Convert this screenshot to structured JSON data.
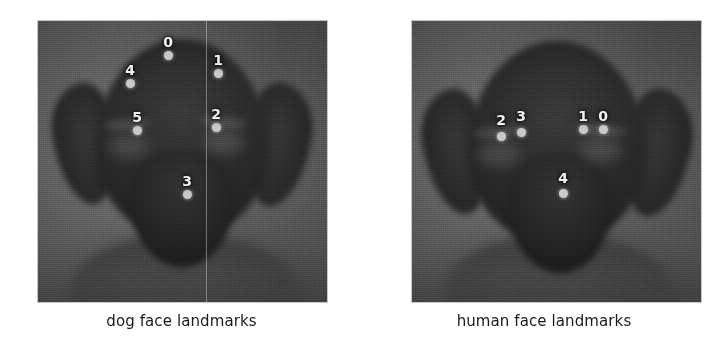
{
  "figure": {
    "width": 725,
    "height": 359,
    "background_color": "#ffffff",
    "marker_color": "#c9c9c9",
    "label_color": "#f2f2f2",
    "caption_color": "#1a1a1a"
  },
  "panels": [
    {
      "id": "dog",
      "caption": "dog face landmarks",
      "photo": {
        "left": 38,
        "top": 21,
        "width": 289,
        "height": 281
      },
      "symmetry_axis_x": 168,
      "landmarks": [
        {
          "id": "0",
          "label": "0",
          "x": 130,
          "y": 34,
          "label_x": 130,
          "label_y": 26
        },
        {
          "id": "1",
          "label": "1",
          "x": 180,
          "y": 52,
          "label_x": 180,
          "label_y": 44
        },
        {
          "id": "2",
          "label": "2",
          "x": 178,
          "y": 106,
          "label_x": 178,
          "label_y": 98
        },
        {
          "id": "3",
          "label": "3",
          "x": 149,
          "y": 173,
          "label_x": 149,
          "label_y": 165
        },
        {
          "id": "4",
          "label": "4",
          "x": 92,
          "y": 62,
          "label_x": 92,
          "label_y": 54
        },
        {
          "id": "5",
          "label": "5",
          "x": 99,
          "y": 109,
          "label_x": 99,
          "label_y": 101
        }
      ]
    },
    {
      "id": "human",
      "caption": "human face landmarks",
      "photo": {
        "left": 412,
        "top": 21,
        "width": 289,
        "height": 281
      },
      "symmetry_axis_x": null,
      "landmarks": [
        {
          "id": "0",
          "label": "0",
          "x": 191,
          "y": 108,
          "label_x": 191,
          "label_y": 100
        },
        {
          "id": "1",
          "label": "1",
          "x": 171,
          "y": 108,
          "label_x": 171,
          "label_y": 100
        },
        {
          "id": "2",
          "label": "2",
          "x": 89,
          "y": 115,
          "label_x": 89,
          "label_y": 104
        },
        {
          "id": "3",
          "label": "3",
          "x": 109,
          "y": 111,
          "label_x": 109,
          "label_y": 100
        },
        {
          "id": "4",
          "label": "4",
          "x": 151,
          "y": 172,
          "label_x": 151,
          "label_y": 162
        }
      ]
    }
  ]
}
